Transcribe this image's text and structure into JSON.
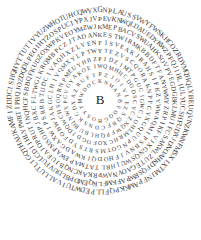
{
  "center_letter": "B",
  "center": {
    "x": 100,
    "y": 101
  },
  "text_color": "#3a3a3a",
  "rings": [
    {
      "radius": 90,
      "size": 7.2,
      "text": "GNPLAUSSVWYFWSKHCOZRDYMQHQLYBEUQVNZKWNFMSXIXTMJNFPAMKKPQFLLPEDWTUIVALLUTLIGQTHAUKAMFIZDDCISHQHYTTUTIVYUZWHOTUHCQWYX"
    },
    {
      "radius": 82,
      "size": 7.0,
      "text": "PEVKNWQLDAUEDYKWZPFQJIHLIULYUCSHFUDXJDNOAHKDFQSRWPAFKMFLKQEMDPBLDUVFULCDIIHLYPWRTIPBQJOZDQDLPEOIHTZOSPUCIYPXJV"
    },
    {
      "radius": 74,
      "size": 6.8,
      "text": "KMEPBACVSWUAHKSOVPVEGDGBKLMUIFCSAKWLZUTEGAOVNAWPRKAKCNQBJUFAIOPRUTINQHCFSBBQFKUDZOXWPKVEOYMZWJ"
    },
    {
      "radius": 66,
      "size": 6.6,
      "text": "KESTWIRMKBBDFTFANYWMYZRPIKFVJXGNQSWUIHRLTATMAPEWAPMSOHPJBXCFLTWGLKRQMBPCZJTADAN"
    },
    {
      "radius": 58,
      "size": 6.4,
      "text": "FISVEAKJRAHSIFKZYWWAQMIPSBNVJFHODQIKWADGAXWIPSRRBTUDCIVAQHXZLVEN"
    },
    {
      "radius": 50,
      "size": 6.2,
      "text": "YTEZVSCQORAKNPPCVXGQUUPNGOTMSRTSYDFOBWJAKGCLHIVQMXYLPTW"
    },
    {
      "radius": 42,
      "size": 6.0,
      "text": "PIDZIMTPGUCIGWCJOHLMRHCXOFOGDJDQWCHSOQRNPMEUYHBZ"
    },
    {
      "radius": 34,
      "size": 5.8,
      "text": "WQMHHCDODSCYCZXQWFPQHLBUBQNWXPCVGYAKOEI"
    },
    {
      "radius": 26,
      "size": 5.6,
      "text": "PZJOIVIEZSQBFCDNSKCDXAZRUFT"
    },
    {
      "radius": 19,
      "size": 5.4,
      "text": "KNMANBFOQGHOSYTMWDOC"
    }
  ]
}
